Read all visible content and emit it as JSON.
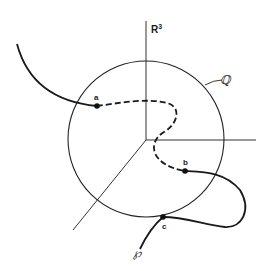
{
  "figure": {
    "space_label": "R",
    "space_exponent": "3",
    "sphere_label": "ℚ",
    "curve_label": "℘",
    "points": [
      {
        "id": "a",
        "label": "a"
      },
      {
        "id": "b",
        "label": "b"
      },
      {
        "id": "c",
        "label": "c"
      }
    ]
  },
  "colors": {
    "line": "#1a1a1a",
    "axis": "#333333",
    "background": "#ffffff"
  }
}
